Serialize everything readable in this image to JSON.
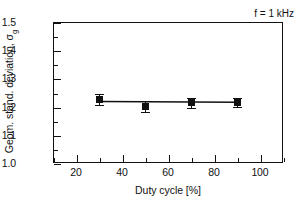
{
  "chart_data": {
    "type": "scatter",
    "title": "",
    "xlabel": "Duty cycle [%]",
    "ylabel": "Geom. stand. deviation, σ",
    "ylabel_subscript": "g",
    "xlim": [
      10,
      110
    ],
    "ylim": [
      1.0,
      1.5
    ],
    "xticks": [
      20,
      40,
      60,
      80,
      100
    ],
    "xtick_labels": [
      "20",
      "40",
      "60",
      "80",
      "100"
    ],
    "xminor_step": 10,
    "yticks": [
      1.0,
      1.1,
      1.2,
      1.3,
      1.4,
      1.5
    ],
    "ytick_labels": [
      "1.0",
      "1.1",
      "1.2",
      "1.3",
      "1.4",
      "1.5"
    ],
    "yminor_step": 0.05,
    "grid": false,
    "legend": false,
    "annotations": [
      {
        "text": "f = 1 kHz",
        "x": 97,
        "y": 1.44
      }
    ],
    "series": [
      {
        "name": "Geometric standard deviation",
        "marker": "square",
        "marker_color": "#111111",
        "line_color": "#111111",
        "x": [
          30,
          50,
          70,
          90
        ],
        "y": [
          1.225,
          1.2,
          1.213,
          1.215
        ],
        "yerr": [
          0.018,
          0.02,
          0.018,
          0.015
        ]
      }
    ],
    "trend_line": {
      "x": [
        30,
        90
      ],
      "y": [
        1.2185,
        1.2155
      ],
      "color": "#111111"
    }
  },
  "figure": {
    "background_color": "#ffffff",
    "axis_color": "#111111"
  }
}
